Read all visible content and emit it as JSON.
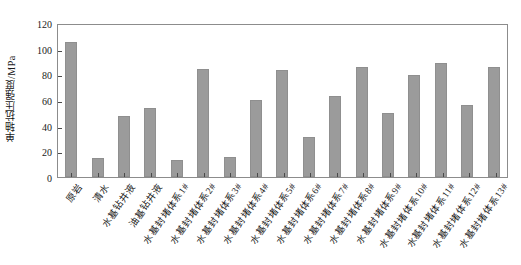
{
  "chart_data": {
    "type": "bar",
    "title": "",
    "xlabel": "",
    "ylabel": "单轴抗压强度/MPa",
    "ylim": [
      0,
      120
    ],
    "yticks": [
      0,
      20,
      40,
      60,
      80,
      100,
      120
    ],
    "grid": false,
    "legend": null,
    "bar_color": "#9b9b9b",
    "categories": [
      "原岩",
      "清水",
      "水基钻井液",
      "油基钻井液",
      "水基封堵体系1#",
      "水基封堵体系2#",
      "水基封堵体系3#",
      "水基封堵体系4#",
      "水基封堵体系5#",
      "水基封堵体系6#",
      "水基封堵体系7#",
      "水基封堵体系8#",
      "水基封堵体系9#",
      "水基封堵体系10#",
      "水基封堵体系11#",
      "水基封堵体系12#",
      "水基封堵体系13#"
    ],
    "values": [
      105,
      15,
      47.5,
      54,
      13,
      84.5,
      15.5,
      60,
      83,
      31.5,
      63.5,
      86,
      50,
      79.5,
      88.5,
      56.5,
      86
    ]
  }
}
